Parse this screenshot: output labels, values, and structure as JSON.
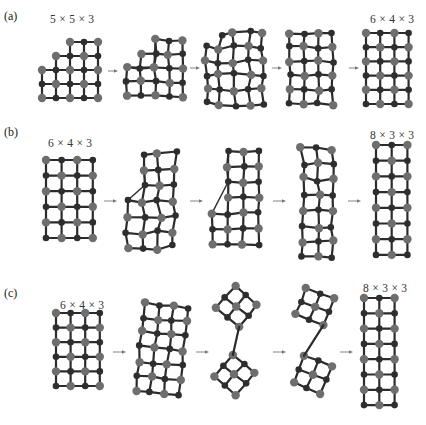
{
  "panels": [
    {
      "id": "a",
      "label": "(a)",
      "label_pos": [
        4,
        9
      ],
      "start_dim": "5 × 5 × 3",
      "start_dim_pos": [
        50,
        13
      ],
      "end_dim": "6 × 4 × 3",
      "end_dim_pos": [
        370,
        13
      ],
      "stages": [
        {
          "x0": 42,
          "y0": 42,
          "cols": 5,
          "rows": 5,
          "step": 14,
          "missing": [
            [
              0,
              0
            ],
            [
              1,
              0
            ],
            [
              0,
              1
            ]
          ],
          "rot": 0
        },
        {
          "x0": 127,
          "y0": 40,
          "cols": 5,
          "rows": 5,
          "step": 14,
          "missing": [
            [
              0,
              0
            ],
            [
              1,
              0
            ],
            [
              0,
              1
            ]
          ],
          "rot": 0,
          "warp": 1
        },
        {
          "x0": 206,
          "y0": 33,
          "cols": 5,
          "rows": 6,
          "step": 14.2,
          "missing": [
            [
              0,
              0
            ]
          ],
          "rot": 0,
          "warp": 2
        },
        {
          "x0": 290,
          "y0": 33,
          "cols": 4,
          "rows": 6,
          "step": 14.2,
          "missing": [],
          "rot": 0,
          "warp": 1
        },
        {
          "x0": 366,
          "y0": 33,
          "cols": 4,
          "rows": 6,
          "step": 14.2,
          "missing": [],
          "rot": 0
        }
      ],
      "arrows": [
        [
          108,
          71,
          118,
          71
        ],
        [
          190,
          68,
          200,
          68
        ],
        [
          272,
          68,
          282,
          68
        ],
        [
          349,
          68,
          359,
          68
        ]
      ]
    },
    {
      "id": "b",
      "label": "(b)",
      "label_pos": [
        4,
        125
      ],
      "start_dim": "6 × 4 × 3",
      "start_dim_pos": [
        48,
        137
      ],
      "end_dim": "8 × 3 × 3",
      "end_dim_pos": [
        370,
        129
      ],
      "stages": [
        {
          "x0": 46,
          "y0": 160,
          "cols": 4,
          "rows": 6,
          "step": 15.6,
          "missing": [],
          "rot": 0
        },
        {
          "x0": 128,
          "y0": 154,
          "cols": 4,
          "rows": 7,
          "step": 15.6,
          "missing": [
            [
              0,
              0
            ],
            [
              0,
              1
            ],
            [
              0,
              2
            ]
          ],
          "rot": 0,
          "warp": 2
        },
        {
          "x0": 212,
          "y0": 151,
          "cols": 4,
          "rows": 7,
          "step": 15.6,
          "missing": [
            [
              0,
              0
            ],
            [
              0,
              1
            ],
            [
              0,
              2
            ],
            [
              0,
              3
            ]
          ],
          "rot": 0,
          "warp": 1
        },
        {
          "x0": 302,
          "y0": 148,
          "cols": 3,
          "rows": 8,
          "step": 15.7,
          "missing": [],
          "rot": 0,
          "warp": 2
        },
        {
          "x0": 376,
          "y0": 145,
          "cols": 3,
          "rows": 8,
          "step": 15.7,
          "missing": [],
          "rot": 0
        }
      ],
      "arrows": [
        [
          104,
          201,
          117,
          201
        ],
        [
          190,
          201,
          203,
          201
        ],
        [
          273,
          201,
          286,
          201
        ],
        [
          348,
          201,
          361,
          201
        ]
      ]
    },
    {
      "id": "c",
      "label": "(c)",
      "label_pos": [
        4,
        286
      ],
      "start_dim": "6 × 4 × 3",
      "start_dim_pos": [
        60,
        299
      ],
      "end_dim": "8 × 3 × 3",
      "end_dim_pos": [
        363,
        282
      ],
      "stages": [
        {
          "x0": 56,
          "y0": 313,
          "cols": 4,
          "rows": 6,
          "step": 14.6,
          "missing": [],
          "rot": 0
        },
        {
          "x0": 140,
          "y0": 305,
          "cols": 4,
          "rows": 7,
          "step": 14.6,
          "missing": [],
          "rot": 6,
          "warp": 1
        },
        {
          "x0": 222,
          "y0": 292,
          "cols": 3,
          "rows": 3,
          "step": 14.6,
          "missing": [],
          "rot": 40,
          "split": true
        },
        {
          "x0": 300,
          "y0": 292,
          "cols": 3,
          "rows": 3,
          "step": 14.6,
          "missing": [],
          "rot": 22,
          "split": true
        },
        {
          "x0": 364,
          "y0": 298,
          "cols": 3,
          "rows": 8,
          "step": 15.3,
          "missing": [],
          "rot": 0
        }
      ],
      "arrows": [
        [
          113,
          352,
          126,
          352
        ],
        [
          196,
          352,
          209,
          352
        ],
        [
          273,
          352,
          286,
          352
        ],
        [
          340,
          352,
          353,
          352
        ]
      ]
    }
  ],
  "colors": {
    "edge": "#2b2b2b",
    "node_light": "#6e6e6e",
    "node_dark": "#2e2e2e",
    "arrow": "#777777",
    "background": "#ffffff"
  }
}
